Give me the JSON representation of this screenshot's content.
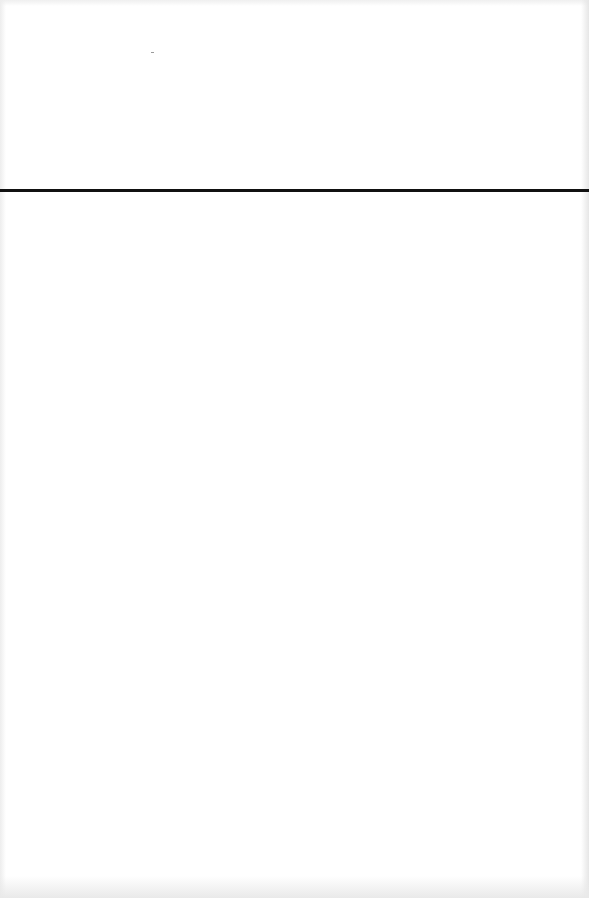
{
  "document": {
    "type": "scanned-blank-page",
    "text_content": "",
    "elements": [
      {
        "kind": "horizontal-rule",
        "y": 190,
        "thickness": 3,
        "color": "#111111"
      }
    ]
  },
  "colors": {
    "paper": "#ffffff",
    "rule": "#111111",
    "scan_edge": "#e9e9e9"
  }
}
